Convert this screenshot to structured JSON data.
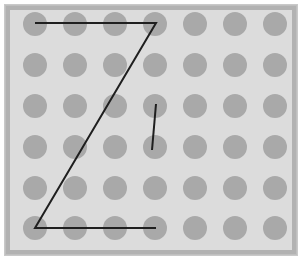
{
  "figure": {
    "title": "",
    "canvas": {
      "width": 302,
      "height": 260
    },
    "colors": {
      "page_background": "#ffffff",
      "outer_frame": "#c9c9c9",
      "bevel_frame": "#b2b2b2",
      "panel_background": "#dcdcdc",
      "dot_fill": "#a9a9a9",
      "stroke": "#1f1f1f"
    }
  },
  "dot_grid": {
    "rows": 6,
    "columns": 7,
    "dot_radius": 12,
    "column_centers_x": [
      35,
      75,
      115,
      155,
      195,
      235,
      275
    ],
    "row_centers_y": [
      24,
      65,
      106,
      147,
      188,
      228
    ]
  },
  "strokes": {
    "width": 2,
    "color": "#1f1f1f",
    "paths": [
      {
        "name": "z-polyline",
        "points": [
          {
            "x": 35,
            "y": 23
          },
          {
            "x": 156,
            "y": 23
          },
          {
            "x": 35,
            "y": 228
          },
          {
            "x": 156,
            "y": 228
          }
        ]
      },
      {
        "name": "short-diagonal",
        "points": [
          {
            "x": 156,
            "y": 104
          },
          {
            "x": 152,
            "y": 150
          }
        ]
      }
    ]
  },
  "annotations": {
    "z_start_label": "",
    "z_end_label": ""
  }
}
